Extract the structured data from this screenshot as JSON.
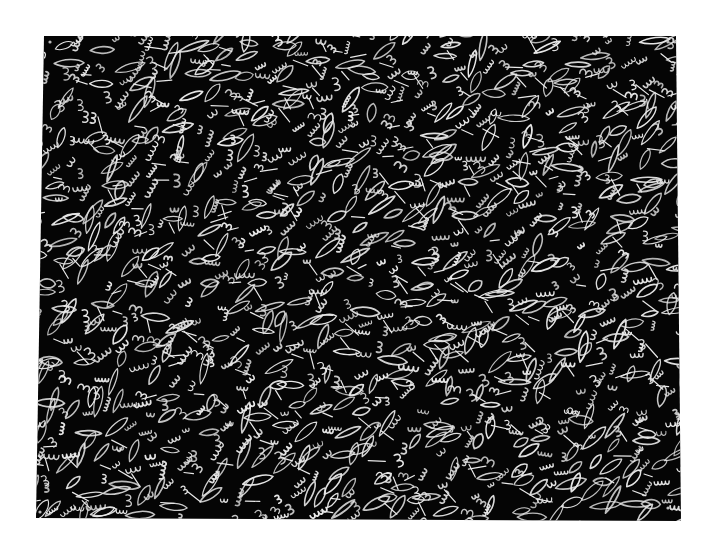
{
  "artwork": {
    "description": "White hand-drawn doodle pattern of leaf loops, scallop squiggles and 3-shaped bumps on a black sheet of paper",
    "background_color": "#ffffff",
    "sheet_color": "#050505",
    "line_color": "#e8e8e8",
    "sheet_corners": {
      "top_left": [
        44,
        36
      ],
      "top_right": [
        676,
        36
      ],
      "bottom_right": [
        681,
        521
      ],
      "bottom_left": [
        36,
        518
      ]
    },
    "motifs": [
      "leaf-loop",
      "scallop-w",
      "bump-3"
    ],
    "pin_holes": [
      [
        50,
        42
      ],
      [
        668,
        42
      ],
      [
        40,
        512
      ],
      [
        668,
        508
      ]
    ]
  }
}
